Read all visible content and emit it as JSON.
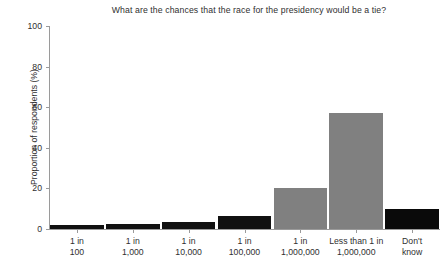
{
  "chart_data": {
    "type": "bar",
    "title": "What are the chances that the race for the presidency would be a tie?",
    "xlabel": "",
    "ylabel": "Proportion of respondents (%)",
    "categories": [
      "1 in 100",
      "1 in 1,000",
      "1 in 10,000",
      "1 in 100,000",
      "1 in 1,000,000",
      "Less than 1 in 1,000,000",
      "Don't know"
    ],
    "category_lines": [
      [
        "1 in",
        "100"
      ],
      [
        "1 in",
        "1,000"
      ],
      [
        "1 in",
        "10,000"
      ],
      [
        "1 in",
        "100,000"
      ],
      [
        "1 in",
        "1,000,000"
      ],
      [
        "Less than 1 in",
        "1,000,000"
      ],
      [
        "Don't",
        "know"
      ]
    ],
    "values": [
      2,
      2.5,
      3.5,
      6.5,
      20,
      57,
      10
    ],
    "bar_colors": [
      "#111111",
      "#111111",
      "#111111",
      "#111111",
      "#808080",
      "#808080",
      "#0a0a0a"
    ],
    "ylim": [
      0,
      100
    ],
    "yticks": [
      0,
      20,
      40,
      60,
      80,
      100
    ],
    "ytick_labels": [
      "0",
      "20",
      "40",
      "60",
      "80",
      "100"
    ],
    "grid": false,
    "legend": "none"
  },
  "colors": {
    "axis": "#9a9a9a",
    "text": "#2f2f2f",
    "background": "#ffffff",
    "bar_dark": "#111111",
    "bar_gray": "#808080"
  }
}
